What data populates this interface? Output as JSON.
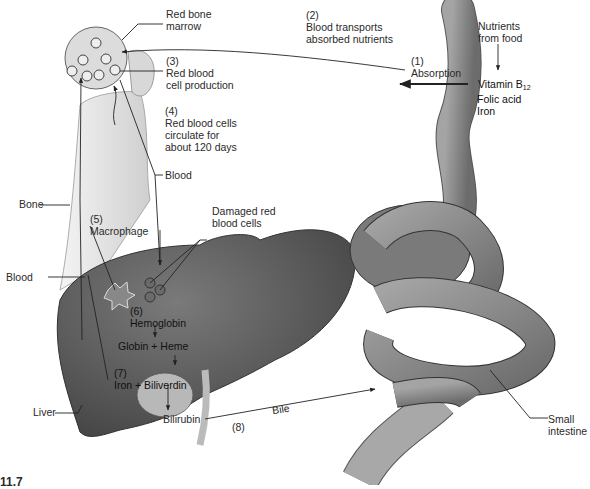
{
  "figure": {
    "number_fragment": "11.7"
  },
  "steps": {
    "s1": {
      "num": "(1)",
      "text": "Absorption"
    },
    "s2": {
      "num": "(2)",
      "line1": "Blood transports",
      "line2": "absorbed nutrients"
    },
    "s3": {
      "num": "(3)",
      "line1": "Red blood",
      "line2": "cell production"
    },
    "s4": {
      "num": "(4)",
      "line1": "Red blood cells",
      "line2": "circulate for",
      "line3": "about 120 days"
    },
    "s5": {
      "num": "(5)",
      "text": "Macrophage"
    },
    "s6": {
      "num": "(6)",
      "text": "Hemoglobin"
    },
    "s7": {
      "num": "(7)",
      "text": "Iron + Biliverdin"
    },
    "s8": {
      "num": "(8)",
      "text": "Bile"
    }
  },
  "labels": {
    "red_bone_marrow": {
      "line1": "Red bone",
      "line2": "marrow"
    },
    "nutrients": {
      "line1": "Nutrients",
      "line2": "from food"
    },
    "vitamin_b12": {
      "text": "Vitamin B",
      "sub": "12"
    },
    "folic_acid": "Folic acid",
    "iron_nutrient": "Iron",
    "blood_upper": "Blood",
    "bone": "Bone",
    "blood_left": "Blood",
    "damaged_rbc": {
      "line1": "Damaged red",
      "line2": "blood cells"
    },
    "globin_heme": "Globin + Heme",
    "liver": "Liver",
    "bilirubin": "Bilirubin",
    "small_intestine": {
      "line1": "Small",
      "line2": "intestine"
    }
  },
  "colors": {
    "liver": "#5f5f5f",
    "intestine": "#8a8a8a",
    "bone": "#e4e4e4",
    "ink": "#222222"
  }
}
